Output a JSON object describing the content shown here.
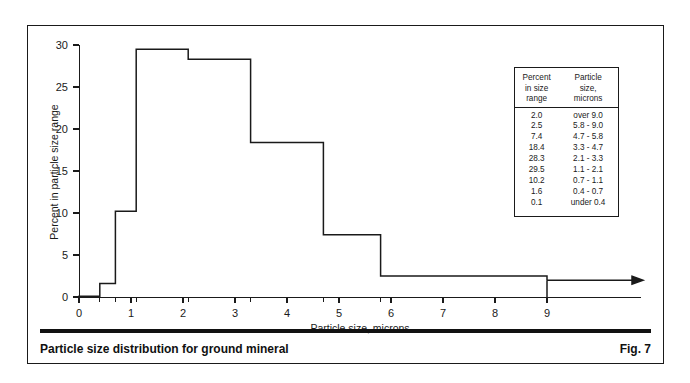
{
  "figure": {
    "caption": "Particle size distribution for ground mineral",
    "number": "Fig. 7"
  },
  "table": {
    "headers": {
      "percent": [
        "Percent",
        "in size",
        "range"
      ],
      "size": [
        "Particle",
        "size,",
        "microns"
      ]
    },
    "rows": [
      {
        "percent": "2.0",
        "size": "over 9.0"
      },
      {
        "percent": "2.5",
        "size": "5.8 - 9.0"
      },
      {
        "percent": "7.4",
        "size": "4.7 - 5.8"
      },
      {
        "percent": "18.4",
        "size": "3.3 - 4.7"
      },
      {
        "percent": "28.3",
        "size": "2.1 - 3.3"
      },
      {
        "percent": "29.5",
        "size": "1.1 - 2.1"
      },
      {
        "percent": "10.2",
        "size": "0.7 - 1.1"
      },
      {
        "percent": "1.6",
        "size": "0.4 - 0.7"
      },
      {
        "percent": "0.1",
        "size": "under 0.4"
      }
    ]
  },
  "chart_data": {
    "type": "bar",
    "title": "Particle size distribution for ground mineral",
    "xlabel": "Particle size, microns",
    "ylabel": "Percent in particle size range",
    "xlim": [
      0,
      10.8
    ],
    "ylim": [
      0,
      30
    ],
    "xticks": [
      0,
      1,
      2,
      3,
      4,
      5,
      6,
      7,
      8,
      9
    ],
    "yticks": [
      0,
      5,
      10,
      15,
      20,
      25,
      30
    ],
    "grid": false,
    "legend": false,
    "bin_edges": [
      0.0,
      0.4,
      0.7,
      1.1,
      2.1,
      3.3,
      4.7,
      5.8,
      9.0
    ],
    "bins": [
      {
        "range": "under 0.4",
        "x0": 0.0,
        "x1": 0.4,
        "value": 0.1
      },
      {
        "range": "0.4 - 0.7",
        "x0": 0.4,
        "x1": 0.7,
        "value": 1.6
      },
      {
        "range": "0.7 - 1.1",
        "x0": 0.7,
        "x1": 1.1,
        "value": 10.2
      },
      {
        "range": "1.1 - 2.1",
        "x0": 1.1,
        "x1": 2.1,
        "value": 29.5
      },
      {
        "range": "2.1 - 3.3",
        "x0": 2.1,
        "x1": 3.3,
        "value": 28.3
      },
      {
        "range": "3.3 - 4.7",
        "x0": 3.3,
        "x1": 4.7,
        "value": 18.4
      },
      {
        "range": "4.7 - 5.8",
        "x0": 4.7,
        "x1": 5.8,
        "value": 7.4
      },
      {
        "range": "5.8 - 9.0",
        "x0": 5.8,
        "x1": 9.0,
        "value": 2.5
      }
    ],
    "open_ended_bin": {
      "range": "over 9.0",
      "x0": 9.0,
      "value": 2.0,
      "arrow": true
    },
    "categories": [
      "under 0.4",
      "0.4 - 0.7",
      "0.7 - 1.1",
      "1.1 - 2.1",
      "2.1 - 3.3",
      "3.3 - 4.7",
      "4.7 - 5.8",
      "5.8 - 9.0",
      "over 9.0"
    ],
    "values": [
      0.1,
      1.6,
      10.2,
      29.5,
      28.3,
      18.4,
      7.4,
      2.5,
      2.0
    ]
  },
  "colors": {
    "ink": "#1a1a1a",
    "rule": "#111111",
    "background": "#ffffff"
  }
}
